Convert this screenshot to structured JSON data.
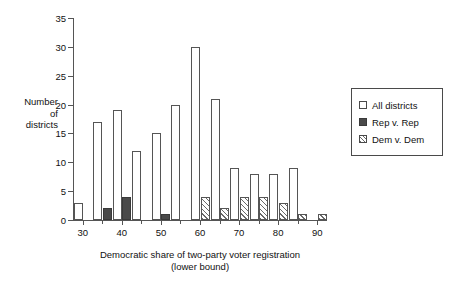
{
  "chart_data": {
    "type": "bar",
    "title": "",
    "xlabel": "Democratic share of two-party voter registration (lower bound)",
    "xlabel_line1": "Democratic share of two-party voter registration",
    "xlabel_line2": "(lower bound)",
    "ylabel": "Number of districts",
    "ylabel_line1": "Number",
    "ylabel_line2": "of",
    "ylabel_line3": "districts",
    "ylim": [
      0,
      35
    ],
    "xlim": [
      27.5,
      92.5
    ],
    "ytick_labels": [
      "0",
      "5",
      "10",
      "15",
      "20",
      "25",
      "30",
      "35"
    ],
    "ytick_values": [
      0,
      5,
      10,
      15,
      20,
      25,
      30,
      35
    ],
    "xtick_labels": [
      "30",
      "40",
      "50",
      "60",
      "70",
      "80",
      "90"
    ],
    "xtick_values": [
      30,
      40,
      50,
      60,
      70,
      80,
      90
    ],
    "categories": [
      30,
      35,
      40,
      45,
      50,
      55,
      60,
      65,
      70,
      75,
      80,
      85,
      90
    ],
    "grid": false,
    "legend_position": "right",
    "series": [
      {
        "name": "All districts",
        "style": "open",
        "color": "#ffffff",
        "values": [
          3,
          17,
          19,
          12,
          15,
          20,
          30,
          21,
          9,
          8,
          8,
          9,
          0
        ]
      },
      {
        "name": "Rep v. Rep",
        "style": "solid-dark",
        "color": "#4a4a4a",
        "values": [
          0,
          2,
          4,
          0,
          1,
          0,
          0,
          0,
          0,
          0,
          0,
          0,
          0
        ]
      },
      {
        "name": "Dem v. Dem",
        "style": "hatched",
        "color": "#6a6a6a",
        "values": [
          0,
          0,
          0,
          0,
          0,
          0,
          4,
          2,
          4,
          4,
          3,
          1,
          1
        ]
      }
    ]
  },
  "legend": {
    "items": [
      {
        "label": "All districts",
        "key": "all"
      },
      {
        "label": "Rep v. Rep",
        "key": "rep"
      },
      {
        "label": "Dem v. Dem",
        "key": "dem"
      }
    ]
  }
}
